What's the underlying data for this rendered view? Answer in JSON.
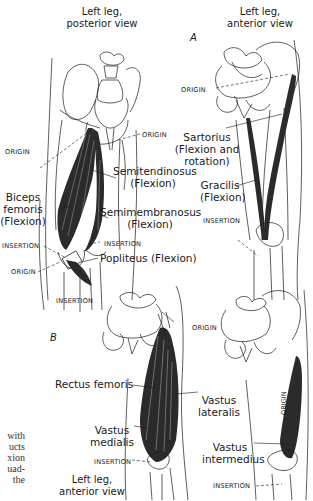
{
  "figure": {
    "panels": [
      {
        "id": "A",
        "label": "A",
        "views": [
          {
            "title_line1": "Left leg,",
            "title_line2": "posterior view",
            "labels": {
              "origin_top": "ORIGIN",
              "origin_left": "ORIGIN",
              "semitendinosus": [
                "Semitendinosus",
                "(Flexion)"
              ],
              "biceps_femoris": [
                "Biceps",
                "femoris",
                "(Flexion)"
              ],
              "semimembranosus": [
                "Semimembranosus",
                "(Flexion)"
              ],
              "insertion_right": "INSERTION",
              "insertion_left": "INSERTION",
              "popliteus": "Popliteus (Flexion)",
              "origin_knee": "ORIGIN",
              "insertion_bottom": "INSERTION"
            }
          },
          {
            "title_line1": "Left leg,",
            "title_line2": "anterior view",
            "labels": {
              "origin": "ORIGIN",
              "sartorius": [
                "Sartorius",
                "(Flexion and",
                "rotation)"
              ],
              "gracilis": [
                "Gracilis",
                "(Flexion)"
              ],
              "insertion": "INSERTION"
            }
          }
        ]
      },
      {
        "id": "B",
        "label": "B",
        "views": [
          {
            "title_line1": "Left leg,",
            "title_line2": "anterior view",
            "labels": {
              "origin": "ORIGIN",
              "rectus_femoris": "Rectus femoris",
              "vastus_lateralis": [
                "Vastus",
                "lateralis"
              ],
              "vastus_medialis": [
                "Vastus",
                "medialis"
              ],
              "insertion": "INSERTION"
            }
          },
          {
            "labels": {
              "origin_vertical": "ORIGIN",
              "vastus_intermedius": [
                "Vastus",
                "intermedius"
              ],
              "insertion": "INSERTION"
            }
          }
        ]
      }
    ],
    "caption_fragment": [
      "with",
      "ucts",
      "xion",
      "uad-",
      "the"
    ],
    "colors": {
      "ink": "#1a1a1a",
      "muscle": "#2b2b2b",
      "paper": "#ffffff"
    }
  }
}
